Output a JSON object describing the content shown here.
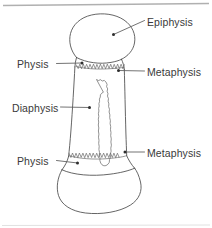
{
  "figure": {
    "background_color": "#ffffff",
    "line_color": "#4a4a4a",
    "text_color": "#3a3a3a",
    "rule_color": "#b8b8b8"
  },
  "labels": {
    "epiphysis_top": "Epiphysis",
    "physis_top": "Physis",
    "metaphysis_top": "Metaphysis",
    "diaphysis": "Diaphysis",
    "physis_bottom": "Physis",
    "metaphysis_bottom": "Metaphysis"
  },
  "regions": [
    {
      "name": "epiphysis",
      "label": "Epiphysis",
      "side": "right",
      "description": "rounded proximal bone head"
    },
    {
      "name": "physis-top",
      "label": "Physis",
      "side": "left",
      "description": "upper growth plate, zigzag line"
    },
    {
      "name": "metaphysis-top",
      "label": "Metaphysis",
      "side": "right",
      "description": "flared region below upper growth plate"
    },
    {
      "name": "diaphysis",
      "label": "Diaphysis",
      "side": "left",
      "description": "shaft with medullary cavity"
    },
    {
      "name": "physis-bottom",
      "label": "Physis",
      "side": "left",
      "description": "lower growth plate, zigzag line"
    },
    {
      "name": "metaphysis-bottom",
      "label": "Metaphysis",
      "side": "right",
      "description": "flared region above lower growth plate"
    }
  ]
}
